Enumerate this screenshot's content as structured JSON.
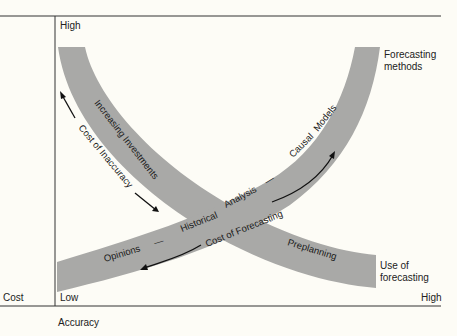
{
  "diagram": {
    "type": "trade-off curves",
    "y_axis": {
      "label": "Cost",
      "high_label": "High",
      "low_label": "Low"
    },
    "x_axis": {
      "label": "Accuracy",
      "low_label": "Low",
      "high_label": "High"
    },
    "bands": [
      {
        "id": "use-of-forecasting",
        "end_label": "Use of forecasting",
        "segments": [
          "Increasing Investments",
          "Preplanning"
        ],
        "direction": "decreasing"
      },
      {
        "id": "forecasting-methods",
        "end_label": "Forecasting methods",
        "segments": [
          "Opinions",
          "—",
          "Historical",
          "Analysis",
          "—",
          "Causal",
          "Models"
        ],
        "direction": "increasing"
      }
    ],
    "annotations": {
      "cost_of_inaccuracy": "Cost of Inaccuracy",
      "cost_of_forecasting": "Cost of Forecasting"
    },
    "colors": {
      "band": "#a9a9a7",
      "background": "#fdfcf6",
      "line": "#222222"
    }
  },
  "labels": {
    "high_top": "High",
    "low": "Low",
    "cost": "Cost",
    "high_right": "High",
    "accuracy": "Accuracy",
    "forecasting_methods_1": "Forecasting",
    "forecasting_methods_2": "methods",
    "use_of_forecasting_1": "Use of",
    "use_of_forecasting_2": "forecasting",
    "increasing_investments": "Increasing Investments",
    "cost_of_inaccuracy": "Cost of Inaccuracy",
    "opinions": "Opinions",
    "dash": "—",
    "historical": "Historical",
    "analysis": "Analysis",
    "causal": "Causal",
    "models": "Models",
    "cost_of_forecasting": "Cost of Forecasting",
    "preplanning": "Preplanning"
  }
}
